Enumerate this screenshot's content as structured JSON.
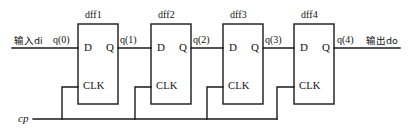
{
  "diagram": {
    "stroke_color": "#1a1a1a",
    "background": "#ffffff",
    "io": {
      "input_label": "输入di",
      "input_signal": "q(0)",
      "output_signal": "q(4)",
      "output_label": "输出do",
      "clock_label": "cp"
    },
    "pins": {
      "d": "D",
      "q": "Q",
      "clk": "CLK"
    },
    "stages": [
      {
        "name": "dff1",
        "out_signal": "q(1)"
      },
      {
        "name": "dff2",
        "out_signal": "q(2)"
      },
      {
        "name": "dff3",
        "out_signal": "q(3)"
      },
      {
        "name": "dff4",
        "out_signal": "q(4)"
      }
    ]
  }
}
